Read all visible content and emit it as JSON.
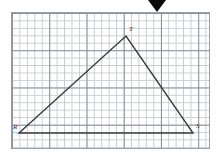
{
  "canvas": {
    "width": 216,
    "height": 158,
    "background": "#ffffff"
  },
  "marker": {
    "name": "down-triangle-marker",
    "shape": "solid-down-triangle",
    "color": "#0a0a0a",
    "x": 148,
    "y": 0,
    "width": 18,
    "height": 12
  },
  "grid": {
    "x": 11,
    "y": 12,
    "width": 199,
    "height": 137,
    "cell_size": 7.45,
    "minor_color": "#c9ccd4",
    "major_color": "#8b9099",
    "major_every": 5,
    "border_color": "#9aa0a8",
    "paper_color": "#ffffff"
  },
  "figure": {
    "type": "triangle",
    "stroke_color": "#3a3a3a",
    "stroke_width": 1.4,
    "vertices": [
      {
        "id": "R",
        "label": "R",
        "x": 19,
        "y": 133,
        "label_dx": -6,
        "label_dy": -9
      },
      {
        "id": "T",
        "label": "T",
        "x": 126,
        "y": 36,
        "label_dx": 3,
        "label_dy": -10
      },
      {
        "id": "S",
        "label": "S",
        "x": 193,
        "y": 133,
        "label_dx": 3,
        "label_dy": -10
      }
    ],
    "edges": [
      {
        "from": "R",
        "to": "T"
      },
      {
        "from": "T",
        "to": "S"
      },
      {
        "from": "S",
        "to": "R"
      }
    ]
  },
  "chart_data": {
    "type": "scatter",
    "title": "",
    "xlabel": "",
    "ylabel": "",
    "grid": true,
    "legend": "none",
    "categories": [
      "R",
      "T",
      "S"
    ],
    "points_grid_units": [
      {
        "label": "R",
        "x": 1,
        "y": 0
      },
      {
        "label": "T",
        "x": 15.4,
        "y": 13
      },
      {
        "label": "S",
        "x": 24.4,
        "y": 0
      }
    ],
    "xlim": [
      0,
      26.7
    ],
    "ylim": [
      0,
      18.4
    ]
  }
}
